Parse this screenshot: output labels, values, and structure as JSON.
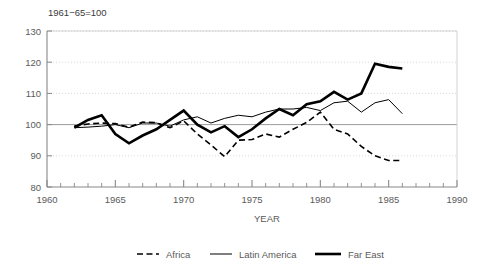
{
  "chart_data": {
    "type": "line",
    "title": "1961−65=100",
    "xlabel": "YEAR",
    "ylabel": "",
    "xlim": [
      1960,
      1990
    ],
    "ylim": [
      80,
      130
    ],
    "xticks": [
      1960,
      1965,
      1970,
      1975,
      1980,
      1985,
      1990
    ],
    "yticks": [
      80,
      90,
      100,
      110,
      120,
      130
    ],
    "xtick_labels": [
      "1960",
      "1965",
      "1970",
      "1975",
      "1980",
      "1985",
      "1990"
    ],
    "ytick_labels": [
      "80",
      "90",
      "100",
      "110",
      "120",
      "130"
    ],
    "minor_xtick_interval": 1,
    "grid": true,
    "grid_axis": "y",
    "legend_position": "bottom",
    "reference_line": 100,
    "x": [
      1962,
      1963,
      1964,
      1965,
      1966,
      1967,
      1968,
      1969,
      1970,
      1971,
      1972,
      1973,
      1974,
      1975,
      1976,
      1977,
      1978,
      1979,
      1980,
      1981,
      1982,
      1983,
      1984,
      1985,
      1986
    ],
    "series": [
      {
        "name": "Africa",
        "style": "dashed",
        "width": 1.6,
        "color": "#000000",
        "values": [
          99.5,
          100.2,
          100.5,
          100.3,
          99.2,
          100.8,
          100.6,
          99.0,
          101.2,
          97.0,
          93.5,
          89.7,
          95.0,
          95.2,
          97.0,
          96.0,
          98.5,
          100.7,
          104.0,
          98.5,
          97.0,
          93.0,
          90.0,
          88.5,
          88.5
        ],
        "values_note": "dashed line, Africa per-capita food production index"
      },
      {
        "name": "Latin America",
        "style": "solid-thin",
        "width": 1.0,
        "color": "#000000",
        "values": [
          99.0,
          99.2,
          99.5,
          100.0,
          99.0,
          100.5,
          100.5,
          99.5,
          101.5,
          102.5,
          100.5,
          102.0,
          103.0,
          102.5,
          104.0,
          105.0,
          105.0,
          105.5,
          104.5,
          107.0,
          107.5,
          104.0,
          107.0,
          108.0,
          103.5
        ],
        "values_note": "thin solid line, Latin America per-capita food production index"
      },
      {
        "name": "Far East",
        "style": "solid-thick",
        "width": 2.6,
        "color": "#000000",
        "values": [
          99.0,
          101.5,
          103.0,
          97.0,
          94.0,
          96.5,
          98.5,
          101.5,
          104.5,
          100.0,
          97.5,
          99.5,
          96.0,
          98.5,
          102.0,
          105.0,
          103.0,
          106.5,
          107.5,
          110.5,
          108.0,
          110.0,
          119.5,
          118.5,
          118.0
        ],
        "values_note": "thick solid line, Far East per-capita food production index"
      }
    ],
    "africa_dip_values": [
      {
        "year": 1983,
        "value": 93.0
      },
      {
        "year": 1984,
        "value": 90.0
      }
    ]
  },
  "legend": {
    "items": [
      {
        "label": "Africa",
        "style": "dashed"
      },
      {
        "label": "Latin America",
        "style": "solid-thin"
      },
      {
        "label": "Far East",
        "style": "solid-thick"
      }
    ]
  },
  "colors": {
    "line": "#000000",
    "grid": "#c8c8c8",
    "axis": "#888888",
    "text": "#5a5a5a",
    "background": "#ffffff"
  }
}
